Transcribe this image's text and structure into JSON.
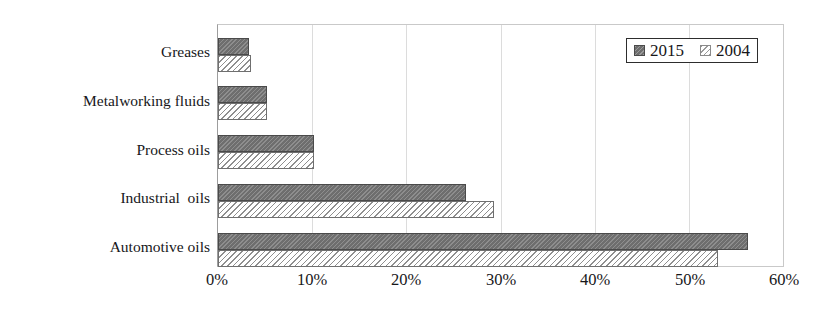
{
  "chart_data": {
    "type": "bar",
    "orientation": "horizontal",
    "title": "",
    "xlabel": "",
    "ylabel": "",
    "xlim": [
      0,
      60
    ],
    "xtick_labels": [
      "0%",
      "10%",
      "20%",
      "30%",
      "40%",
      "50%",
      "60%"
    ],
    "xtick_values": [
      0,
      10,
      20,
      30,
      40,
      50,
      60
    ],
    "grid": true,
    "grid_axis": "x",
    "legend_position": "top-right",
    "categories": [
      "Greases",
      "Metalworking fluids",
      "Process oils",
      "Industrial  oils",
      "Automotive oils"
    ],
    "series": [
      {
        "name": "2015",
        "color": "#6e6e6e",
        "pattern": "solid-dark",
        "values": [
          3.3,
          5.2,
          10.2,
          26.3,
          56.3
        ]
      },
      {
        "name": "2004",
        "color": "#ffffff",
        "pattern": "diagonal-hatch",
        "values": [
          3.5,
          5.2,
          10.2,
          29.3,
          53.1
        ]
      }
    ],
    "value_unit": "%"
  },
  "legend": {
    "entries": [
      {
        "label": "2015",
        "swatch": "dark-solid-square-icon"
      },
      {
        "label": "2004",
        "swatch": "hatched-square-icon"
      }
    ]
  },
  "colors": {
    "series_2015": "#6e6e6e",
    "series_2004": "#ffffff",
    "hatch_stroke": "#8f8f8f",
    "gridline": "#dcdcdc",
    "axis": "#9d9d9d",
    "text": "#17171a",
    "background": "#ffffff"
  }
}
